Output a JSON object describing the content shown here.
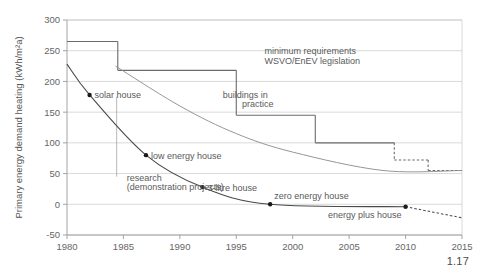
{
  "figure": {
    "caption": "1.17"
  },
  "chart_data": {
    "type": "line",
    "title": "",
    "xlabel": "",
    "ylabel": "Primary energy demand heating (kWh/m²a)",
    "xlim": [
      1980,
      2015
    ],
    "ylim": [
      -50,
      300
    ],
    "xticks": [
      1980,
      1985,
      1990,
      1995,
      2000,
      2005,
      2010,
      2015
    ],
    "yticks": [
      -50,
      0,
      50,
      100,
      150,
      200,
      250,
      300
    ],
    "grid": "horizontal",
    "legend": "none",
    "series": [
      {
        "name": "WSVO/EnEV legislation minimum requirements",
        "style": "step",
        "color": "#6b6b6b",
        "steps": [
          {
            "x_start": 1980,
            "x_end": 1984.5,
            "value": 265,
            "dashed": false
          },
          {
            "x_start": 1984.5,
            "x_end": 1995,
            "value": 218,
            "dashed": false
          },
          {
            "x_start": 1995,
            "x_end": 2002,
            "value": 145,
            "dashed": false
          },
          {
            "x_start": 2002,
            "x_end": 2009,
            "value": 100,
            "dashed": false
          },
          {
            "x_start": 2009,
            "x_end": 2012,
            "value": 72,
            "dashed": true
          },
          {
            "x_start": 2012,
            "x_end": 2015,
            "value": 55,
            "dashed": true
          }
        ]
      },
      {
        "name": "buildings in practice",
        "style": "curve",
        "color": "#8a8a8a",
        "points": [
          {
            "x": 1984.3,
            "y": 225
          },
          {
            "x": 1990,
            "y": 160
          },
          {
            "x": 1995,
            "y": 115
          },
          {
            "x": 2000,
            "y": 85
          },
          {
            "x": 2008,
            "y": 55
          },
          {
            "x": 2015,
            "y": 55
          }
        ]
      },
      {
        "name": "demonstration projects / best practice",
        "style": "curve",
        "color": "#4a4a4a",
        "points": [
          {
            "x": 1980,
            "y": 228
          },
          {
            "x": 1982,
            "y": 178
          },
          {
            "x": 1987,
            "y": 80
          },
          {
            "x": 1992,
            "y": 28
          },
          {
            "x": 1998,
            "y": 0
          },
          {
            "x": 2010,
            "y": -4
          },
          {
            "x": 2015,
            "y": -22
          }
        ],
        "dashed_after_x": 2010
      }
    ],
    "markers": [
      {
        "label": "solar house",
        "x": 1982,
        "y": 178
      },
      {
        "label": "low energy house",
        "x": 1987,
        "y": 80
      },
      {
        "label": "3-litre house",
        "x": 1992,
        "y": 28
      },
      {
        "label": "zero energy house",
        "x": 1998,
        "y": 0
      },
      {
        "label": "energy plus house",
        "x": 2010,
        "y": -4
      }
    ],
    "annotations": [
      {
        "id": "minimum-requirements",
        "text": "minimum requirements",
        "x": 1997.5,
        "y": 245
      },
      {
        "id": "wsvo-enev-legislation",
        "text": "WSVO/EnEV legislation",
        "x": 1997.5,
        "y": 228
      },
      {
        "id": "buildings-in-practice-line1",
        "text": "buildings in",
        "x": 1993.8,
        "y": 173
      },
      {
        "id": "buildings-in-practice-line2",
        "text": "practice",
        "x": 1995.5,
        "y": 158
      },
      {
        "id": "research-line1",
        "text": "research",
        "x": 1985.3,
        "y": 38
      },
      {
        "id": "research-line2",
        "text": "(demonstration projects)",
        "x": 1985.3,
        "y": 23
      }
    ]
  }
}
